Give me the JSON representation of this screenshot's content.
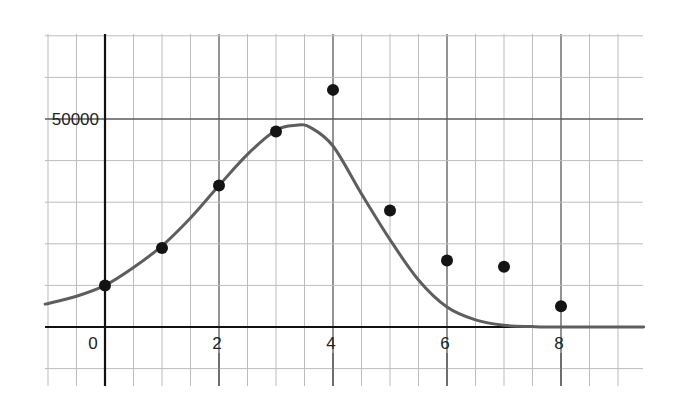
{
  "chart_data": {
    "type": "scatter",
    "title": "",
    "xlabel": "",
    "ylabel": "",
    "xlim": [
      -1.05,
      9.45
    ],
    "ylim": [
      -14000,
      70000
    ],
    "grid": true,
    "x_tick_labels": [
      "0",
      "2",
      "4",
      "6",
      "8"
    ],
    "x_ticks": [
      0,
      2,
      4,
      6,
      8
    ],
    "y_tick_labels": [
      "50000"
    ],
    "y_ticks": [
      50000
    ],
    "x_grid_step": 0.5,
    "y_grid_step": 10000,
    "legend": null,
    "series": [
      {
        "name": "data points",
        "kind": "scatter",
        "x": [
          0,
          1,
          2,
          3,
          4,
          5,
          6,
          7,
          8
        ],
        "y": [
          10000,
          19000,
          34000,
          47000,
          57000,
          28000,
          16000,
          14500,
          5000
        ]
      },
      {
        "name": "fitted curve",
        "kind": "line",
        "x": [
          -1.05,
          -0.5,
          0,
          0.5,
          1,
          1.5,
          2,
          2.5,
          3,
          3.35,
          3.6,
          4,
          4.5,
          5,
          5.5,
          6,
          6.5,
          7,
          7.5,
          8,
          9.45
        ],
        "y": [
          5500,
          7400,
          10000,
          14300,
          19500,
          26200,
          34000,
          41500,
          47300,
          48500,
          48000,
          43500,
          32000,
          21000,
          11300,
          4800,
          1700,
          400,
          100,
          0,
          0
        ]
      }
    ]
  },
  "axes": {
    "y_label_50000": "50000",
    "x_label_0": "0",
    "x_label_2": "2",
    "x_label_4": "4",
    "x_label_6": "6",
    "x_label_8": "8"
  },
  "colors": {
    "background": "#ffffff",
    "grid_minor": "#bdbdbd",
    "grid_major": "#5a5a5a",
    "axis": "#111111",
    "curve": "#5e5e5e",
    "points": "#141414",
    "text": "#222222"
  }
}
